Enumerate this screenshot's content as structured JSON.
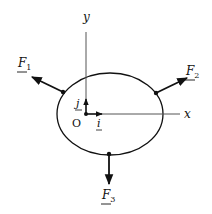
{
  "diagram": {
    "title": "",
    "colors": {
      "ink": "#111111",
      "axis": "#555555",
      "background": "#ffffff"
    },
    "body": {
      "shape": "ellipse",
      "cx": 110,
      "cy": 114,
      "rx": 53,
      "ry": 41
    },
    "axes": {
      "x_label": "x",
      "y_label": "y",
      "origin_label": "O"
    },
    "unit_vectors": {
      "i_label": "i",
      "j_label": "j"
    },
    "forces": [
      {
        "id": "F1",
        "label": "F",
        "subscript": "1"
      },
      {
        "id": "F2",
        "label": "F",
        "subscript": "2"
      },
      {
        "id": "F3",
        "label": "F",
        "subscript": "3"
      }
    ]
  }
}
